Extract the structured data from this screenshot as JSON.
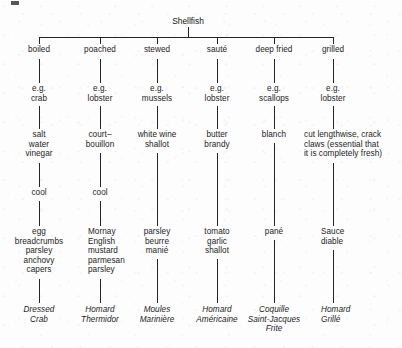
{
  "diagram": {
    "root": "Shellfish",
    "columns": [
      {
        "method": "boiled",
        "example": "e.g.\ncrab",
        "ingredients": "salt\nwater\nvinegar",
        "step": "cool",
        "finish": "egg\nbreadcrumbs\nparsley\nanchovy\ncapers",
        "dish": "Dressed\nCrab"
      },
      {
        "method": "poached",
        "example": "e.g.\nlobster",
        "ingredients": "court–\nbouillon",
        "step": "cool",
        "finish": "Mornay\nEnglish\n  mustard\nparmesan\nparsley",
        "dish": "Homard\nThermidor"
      },
      {
        "method": "stewed",
        "example": "e.g.\nmussels",
        "ingredients": "white wine\nshallot",
        "step": "",
        "finish": "parsley\nbeurre\nmanié",
        "dish": "Moules\nMarinière"
      },
      {
        "method": "sauté",
        "example": "e.g.\nlobster",
        "ingredients": "butter\nbrandy",
        "step": "",
        "finish": "tomato\ngarlic\nshallot",
        "dish": "Homard\nAméricaine"
      },
      {
        "method": "deep fried",
        "example": "e.g.\nscallops",
        "ingredients": "blanch",
        "step": "",
        "finish": "pané",
        "dish": "Coquille\nSaint-Jacques\nFrite"
      },
      {
        "method": "grilled",
        "example": "e.g.\nlobster",
        "ingredients": "cut lengthwise, crack\nclaws (essential that\nit is completely fresh)",
        "step": "",
        "finish": "Sauce\ndiable",
        "dish": "Homard\nGrillé"
      }
    ]
  },
  "style": {
    "ink": "#242424",
    "paper": "#fdfdfd"
  }
}
